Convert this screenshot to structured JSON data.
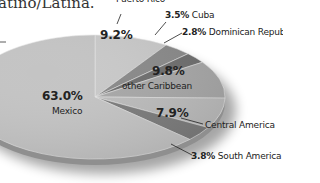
{
  "chart_data": {
    "type": "pie",
    "title_visible_fragment": "atino/Latina.",
    "style": "3d-tilted",
    "unit": "%",
    "slices": [
      {
        "label": "Puerto Rico",
        "value": 9.2,
        "display": "9.2%",
        "color": "#c9c9c9"
      },
      {
        "label": "Cuba",
        "value": 3.5,
        "display": "3.5%",
        "color": "#8a8a8a"
      },
      {
        "label": "Dominican Republic",
        "value": 2.8,
        "display": "2.8%",
        "color": "#6f6f6f"
      },
      {
        "label": "other Caribbean",
        "value": 9.8,
        "display": "9.8%",
        "color": "#a8a8a8"
      },
      {
        "label": "Central America",
        "value": 7.9,
        "display": "7.9%",
        "color": "#bcbcbc"
      },
      {
        "label": "South America",
        "value": 3.8,
        "display": "3.8%",
        "color": "#7c7c7c"
      },
      {
        "label": "Mexico",
        "value": 63.0,
        "display": "63.0%",
        "color": "#c4c4c4"
      }
    ]
  },
  "labels": {
    "title": "atino/Latina.",
    "puerto_rico_name": "Puerto Rico",
    "puerto_rico_pct": "9.2%",
    "cuba_pct": "3.5%",
    "cuba_name": "Cuba",
    "dominican_pct": "2.8%",
    "dominican_name": "Dominican Republic",
    "other_caribbean_pct": "9.8%",
    "other_caribbean_name": "other Caribbean",
    "central_america_pct": "7.9%",
    "central_america_name": "Central America",
    "south_america_pct": "3.8%",
    "south_america_name": "South America",
    "mexico_pct": "63.0%",
    "mexico_name": "Mexico"
  }
}
